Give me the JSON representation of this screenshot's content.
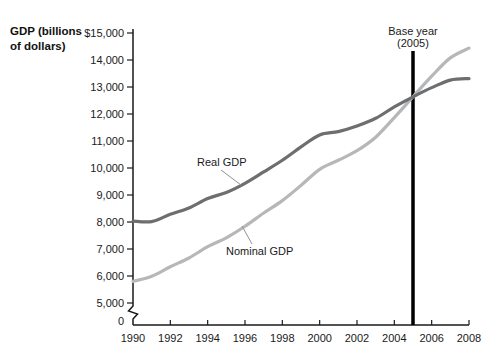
{
  "header": {
    "line1": "GDP (billions",
    "line2": "of dollars)"
  },
  "annotations": {
    "real_label": "Real GDP",
    "nominal_label": "Nominal GDP",
    "base_year_line1": "Base year",
    "base_year_line2": "(2005)"
  },
  "colors": {
    "real_curve": "#6d6e70",
    "nominal_curve": "#b5b7b9",
    "base_year_line": "#000000",
    "axis": "#1a1a1a",
    "pointer": "#909194"
  },
  "chart_data": {
    "type": "line",
    "title": "",
    "xlabel": "",
    "ylabel": "GDP (billions of dollars)",
    "x": [
      1990,
      1991,
      1992,
      1993,
      1994,
      1995,
      1996,
      1997,
      1998,
      1999,
      2000,
      2001,
      2002,
      2003,
      2004,
      2005,
      2006,
      2007,
      2008
    ],
    "series": [
      {
        "name": "Real GDP",
        "color": "#6d6e70",
        "values": [
          8034,
          8015,
          8287,
          8523,
          8871,
          9094,
          9434,
          9854,
          10284,
          10780,
          11226,
          11347,
          11553,
          11841,
          12264,
          12638,
          12976,
          13254,
          13312
        ]
      },
      {
        "name": "Nominal GDP",
        "color": "#b5b7b9",
        "values": [
          5801,
          5992,
          6342,
          6667,
          7085,
          7415,
          7839,
          8332,
          8794,
          9354,
          9952,
          10286,
          10642,
          11142,
          11868,
          12638,
          13399,
          14078,
          14441
        ]
      }
    ],
    "ylim": [
      0,
      15000
    ],
    "xlim": [
      1990,
      2008
    ],
    "ytick_values": [
      15000,
      14000,
      13000,
      12000,
      11000,
      10000,
      9000,
      8000,
      7000,
      6000,
      5000,
      0
    ],
    "ytick_labels": [
      "$15,000",
      "14,000",
      "13,000",
      "12,000",
      "11,000",
      "10,000",
      "9,000",
      "8,000",
      "7,000",
      "6,000",
      "5,000",
      "0"
    ],
    "xtick_labels": [
      "1990",
      "1992",
      "1994",
      "1996",
      "1998",
      "2000",
      "2002",
      "2004",
      "2006",
      "2008"
    ],
    "axis_break_below": 5000,
    "grid": false,
    "legend_position": "inline-annotations",
    "base_year_marker": {
      "x": 2005,
      "label": "Base year (2005)"
    }
  }
}
